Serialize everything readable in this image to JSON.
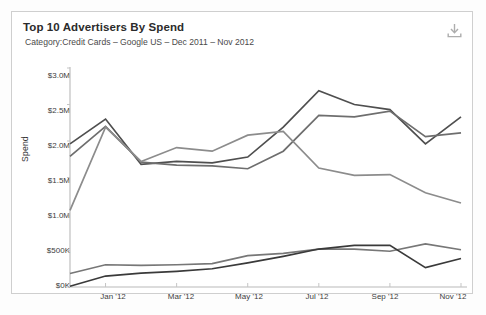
{
  "card": {
    "title": "Top 10 Advertisers By Spend",
    "subtitle": "Category:Credit Cards – Google US – Dec 2011 – Nov 2012",
    "download_label": "download-icon",
    "border_color": "#cfcfcf",
    "background": "#ffffff"
  },
  "chart_data": {
    "type": "line",
    "title": "Top 10 Advertisers By Spend",
    "subtitle": "Category:Credit Cards – Google US – Dec 2011 – Nov 2012",
    "xlabel": "",
    "ylabel": "Spend",
    "grid": false,
    "legend": "none",
    "x": [
      "Dec '11",
      "Jan '12",
      "Feb '12",
      "Mar '12",
      "Apr '12",
      "May '12",
      "Jun '12",
      "Jul '12",
      "Aug '12",
      "Sep '12",
      "Oct '12",
      "Nov '12"
    ],
    "x_tick_labels": [
      "Jan '12",
      "Mar '12",
      "May '12",
      "Jul '12",
      "Sep '12",
      "Nov '12"
    ],
    "x_tick_indices": [
      1,
      3,
      5,
      7,
      9,
      11
    ],
    "y_tick_labels": [
      "$3.0M",
      "$2.5M",
      "$2.0M",
      "$1.5M",
      "$1.0M",
      "$500K",
      "$0K"
    ],
    "y_tick_values": [
      3000000,
      2500000,
      2000000,
      1500000,
      1000000,
      500000,
      0
    ],
    "ylim": [
      0,
      3000000
    ],
    "series": [
      {
        "name": "series-1",
        "color": "#4f4f4f",
        "values": [
          1960000,
          2300000,
          1680000,
          1720000,
          1700000,
          1780000,
          2190000,
          2690000,
          2500000,
          2430000,
          1960000,
          2330000
        ]
      },
      {
        "name": "series-2",
        "color": "#6e6e6e",
        "values": [
          1790000,
          2200000,
          1710000,
          1670000,
          1660000,
          1620000,
          1860000,
          2350000,
          2330000,
          2410000,
          2060000,
          2110000
        ]
      },
      {
        "name": "series-3",
        "color": "#8c8c8c",
        "values": [
          1050000,
          2190000,
          1720000,
          1910000,
          1860000,
          2080000,
          2130000,
          1630000,
          1530000,
          1540000,
          1290000,
          1150000
        ]
      },
      {
        "name": "series-4",
        "color": "#777777",
        "values": [
          185000,
          305000,
          295000,
          305000,
          320000,
          430000,
          460000,
          520000,
          520000,
          490000,
          590000,
          510000
        ]
      },
      {
        "name": "series-5",
        "color": "#3a3a3a",
        "values": [
          10000,
          150000,
          190000,
          215000,
          250000,
          330000,
          420000,
          520000,
          570000,
          570000,
          265000,
          390000
        ]
      }
    ]
  }
}
